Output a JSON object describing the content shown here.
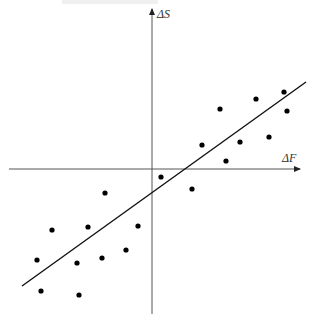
{
  "chart_data": {
    "type": "scatter",
    "title": "",
    "xlabel": "ΔF",
    "ylabel": "ΔS",
    "axes_style": "cross-at-origin with arrows",
    "grid": false,
    "legend": null,
    "ticks": "none",
    "origin_px": [
      152,
      169
    ],
    "points_px": [
      [
        220,
        109
      ],
      [
        256,
        99
      ],
      [
        284,
        92
      ],
      [
        287,
        111
      ],
      [
        202,
        145
      ],
      [
        240,
        142
      ],
      [
        269,
        137
      ],
      [
        226,
        161
      ],
      [
        192,
        189
      ],
      [
        161,
        177
      ],
      [
        105,
        193
      ],
      [
        52,
        230
      ],
      [
        88,
        227
      ],
      [
        138,
        226
      ],
      [
        126,
        250
      ],
      [
        37,
        260
      ],
      [
        77,
        263
      ],
      [
        102,
        258
      ],
      [
        41,
        291
      ],
      [
        79,
        295
      ]
    ],
    "points_relative": [
      {
        "x": 68,
        "y": 60
      },
      {
        "x": 104,
        "y": 70
      },
      {
        "x": 132,
        "y": 77
      },
      {
        "x": 135,
        "y": 58
      },
      {
        "x": 50,
        "y": 24
      },
      {
        "x": 88,
        "y": 27
      },
      {
        "x": 117,
        "y": 32
      },
      {
        "x": 74,
        "y": 8
      },
      {
        "x": 40,
        "y": -20
      },
      {
        "x": 9,
        "y": -8
      },
      {
        "x": -47,
        "y": -24
      },
      {
        "x": -100,
        "y": -61
      },
      {
        "x": -64,
        "y": -58
      },
      {
        "x": -14,
        "y": -57
      },
      {
        "x": -26,
        "y": -81
      },
      {
        "x": -115,
        "y": -91
      },
      {
        "x": -75,
        "y": -94
      },
      {
        "x": -50,
        "y": -89
      },
      {
        "x": -111,
        "y": -122
      },
      {
        "x": -73,
        "y": -126
      }
    ],
    "fit_line_px": {
      "x1": 22,
      "y1": 286,
      "x2": 306,
      "y2": 82
    },
    "fit_line_description": "positive-slope regression line through scatter"
  },
  "axes": {
    "x_label": "ΔF",
    "y_label": "ΔS",
    "x_axis_px": {
      "x1": 9,
      "y1": 169,
      "x2": 300,
      "y2": 169
    },
    "y_axis_px": {
      "x1": 152,
      "y1": 314,
      "x2": 152,
      "y2": 9
    }
  },
  "colors": {
    "axis": "#555555",
    "points": "#000000",
    "line": "#111111"
  }
}
